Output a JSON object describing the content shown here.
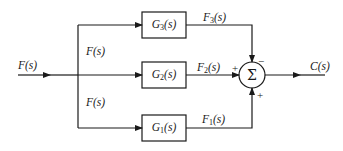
{
  "diagram": {
    "type": "block-diagram",
    "input": {
      "label": "F(s)"
    },
    "branch_labels": {
      "upper": "F(s)",
      "lower": "F(s)"
    },
    "blocks": [
      {
        "id": "G3",
        "name": "G",
        "sub": "3",
        "arg": "(s)",
        "output": {
          "name": "F",
          "sub": "3",
          "arg": "(s)"
        }
      },
      {
        "id": "G2",
        "name": "G",
        "sub": "2",
        "arg": "(s)",
        "output": {
          "name": "F",
          "sub": "2",
          "arg": "(s)"
        }
      },
      {
        "id": "G1",
        "name": "G",
        "sub": "1",
        "arg": "(s)",
        "output": {
          "name": "F",
          "sub": "1",
          "arg": "(s)"
        }
      }
    ],
    "summing_junction": {
      "symbol": "Σ",
      "signs": {
        "top": "−",
        "left": "+",
        "bottom": "+"
      }
    },
    "output": {
      "label": "C(s)"
    },
    "colors": {
      "line": "#1a1a1a",
      "background": "#ffffff"
    }
  }
}
